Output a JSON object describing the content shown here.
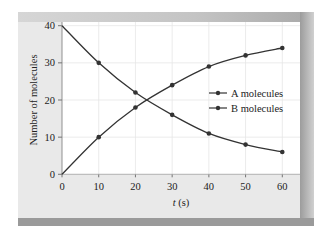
{
  "chart_data": {
    "type": "line",
    "title": "",
    "xlabel": "t (s)",
    "ylabel": "Number of molecules",
    "x": [
      0,
      10,
      20,
      30,
      40,
      50,
      60
    ],
    "xticks": [
      0,
      10,
      20,
      30,
      40,
      50,
      60
    ],
    "yticks": [
      0,
      10,
      20,
      30,
      40
    ],
    "xlim": [
      0,
      60
    ],
    "ylim": [
      0,
      40
    ],
    "grid": true,
    "legend_position": "right-center inside",
    "series": [
      {
        "name": "A molecules",
        "values": [
          40,
          30,
          22,
          16,
          11,
          8,
          6
        ],
        "color": "#333333"
      },
      {
        "name": "B molecules",
        "values": [
          0,
          10,
          18,
          24,
          29,
          32,
          34
        ],
        "color": "#333333"
      }
    ]
  },
  "legend": {
    "items": [
      {
        "label": "A molecules"
      },
      {
        "label": "B molecules"
      }
    ]
  },
  "axes": {
    "x_title_italic": "t",
    "x_title_unit": " (s)",
    "y_title": "Number of molecules"
  }
}
